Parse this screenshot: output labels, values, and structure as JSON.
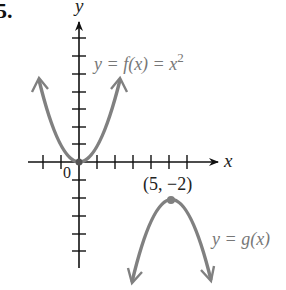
{
  "problem_number": "5.",
  "axes": {
    "x_label": "x",
    "y_label": "y",
    "origin_label": "0"
  },
  "curves": [
    {
      "name": "f",
      "label_prefix": "y = f(x) = x",
      "label_exp": "2",
      "vertex": [
        0,
        0
      ],
      "opens": "up"
    },
    {
      "name": "g",
      "label": "y = g(x)",
      "vertex": [
        5,
        -2
      ],
      "opens": "down"
    }
  ],
  "point_label": "(5, −2)",
  "colors": {
    "axis": "#111111",
    "curve": "#808080",
    "label": "#7a7a7a"
  }
}
